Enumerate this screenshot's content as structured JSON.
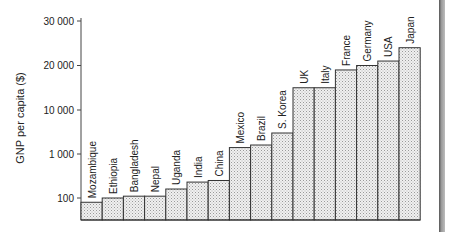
{
  "chart_data": {
    "type": "bar",
    "title": "",
    "xlabel": "",
    "ylabel": "GNP per capita ($)",
    "yscale": "log below 10 000, linear above",
    "y_ticks": [
      "100",
      "1 000",
      "10 000",
      "20 000",
      "30 000"
    ],
    "ylim": [
      30,
      30000
    ],
    "grid": false,
    "legend": null,
    "categories": [
      "Mozambique",
      "Ethiopia",
      "Bangladesh",
      "Nepal",
      "Uganda",
      "India",
      "China",
      "Mexico",
      "Brazil",
      "S. Korea",
      "UK",
      "Italy",
      "France",
      "Germany",
      "USA",
      "Japan"
    ],
    "values": [
      80,
      100,
      110,
      110,
      160,
      230,
      250,
      1400,
      1600,
      3000,
      15000,
      15000,
      19000,
      20000,
      21000,
      24000
    ]
  },
  "colors": {
    "bar_fill": "#e6e6e6",
    "bar_stroke": "#333333",
    "axis": "#444444",
    "right_edge_bar": "#8c8c8c"
  }
}
